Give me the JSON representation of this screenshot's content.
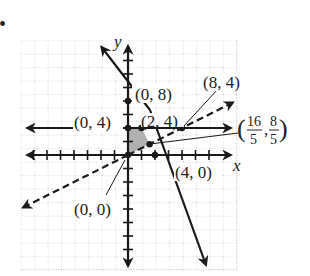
{
  "figure": {
    "bullet": "•",
    "axes": {
      "x_label": "x",
      "y_label": "y"
    },
    "grid": {
      "spacing_units": 2,
      "x_range": [
        -16,
        16
      ],
      "y_range": [
        -16,
        16
      ]
    },
    "colors": {
      "line": "#1a1a1a",
      "grid": "#b5b5b5",
      "shade": "#b0b0b0"
    },
    "lines": [
      {
        "name": "solid-steep-line",
        "equation": "y = 8 - 2x",
        "style": "solid"
      },
      {
        "name": "horizontal-line",
        "equation": "y = 4",
        "style": "solid"
      },
      {
        "name": "dashed-line",
        "equation": "y = x/2",
        "style": "dashed"
      }
    ],
    "feasible_region_vertices": [
      "(0, 0)",
      "(0, 4)",
      "(2, 4)",
      "(16/5, 8/5)"
    ],
    "points": {
      "p08": "(0, 8)",
      "p04": "(0, 4)",
      "p24": "(2, 4)",
      "p84": "(8, 4)",
      "p_frac_open": "(",
      "p_frac_x_num": "16",
      "p_frac_x_den": "5",
      "p_frac_comma": ",",
      "p_frac_y_num": "8",
      "p_frac_y_den": "5",
      "p_frac_close": ")",
      "p40": "(4, 0)",
      "p00": "(0, 0)"
    }
  }
}
